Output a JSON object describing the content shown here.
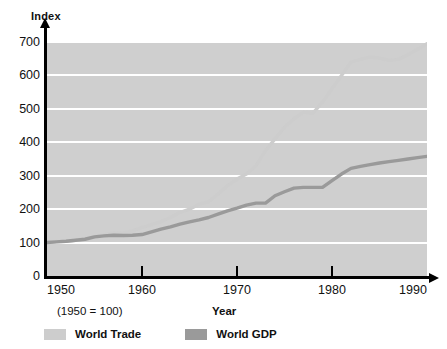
{
  "chart_data": {
    "type": "line",
    "title": "",
    "subtitle": "(1950 = 100)",
    "ylabel": "Index",
    "xlabel": "Year",
    "xlim": [
      1950,
      1990
    ],
    "ylim": [
      0,
      700
    ],
    "grid": true,
    "legend_position": "bottom-left",
    "xticks": [
      1950,
      1960,
      1970,
      1980,
      1990
    ],
    "xtick_labels": [
      "1950",
      "1960",
      "1970",
      "1980",
      "1990"
    ],
    "yticks": [
      0,
      100,
      200,
      300,
      400,
      500,
      600,
      700
    ],
    "ytick_labels": [
      "0",
      "100",
      "200",
      "300",
      "400",
      "500",
      "600",
      "700"
    ],
    "plot_background": "#cfcfcf",
    "gridline_color": "#ffffff",
    "series": [
      {
        "name": "World Trade",
        "color": "#cdcdcd",
        "x": [
          1950,
          1951,
          1952,
          1953,
          1954,
          1955,
          1956,
          1957,
          1958,
          1959,
          1960,
          1961,
          1962,
          1963,
          1964,
          1965,
          1966,
          1967,
          1968,
          1969,
          1970,
          1971,
          1972,
          1973,
          1974,
          1975,
          1976,
          1977,
          1978,
          1979,
          1980,
          1981,
          1982,
          1983,
          1984,
          1985,
          1986,
          1987,
          1988,
          1989,
          1990
        ],
        "values": [
          100,
          103,
          104,
          107,
          112,
          118,
          124,
          129,
          128,
          135,
          145,
          154,
          163,
          175,
          190,
          200,
          215,
          222,
          245,
          270,
          290,
          305,
          330,
          375,
          410,
          445,
          470,
          490,
          487,
          520,
          560,
          600,
          640,
          648,
          655,
          652,
          645,
          648,
          662,
          678,
          695
        ]
      },
      {
        "name": "World GDP",
        "color": "#9a9a9a",
        "x": [
          1950,
          1951,
          1952,
          1953,
          1954,
          1955,
          1956,
          1957,
          1958,
          1959,
          1960,
          1961,
          1962,
          1963,
          1964,
          1965,
          1966,
          1967,
          1968,
          1969,
          1970,
          1971,
          1972,
          1973,
          1974,
          1975,
          1976,
          1977,
          1978,
          1979,
          1980,
          1981,
          1982,
          1983,
          1984,
          1985,
          1986,
          1987,
          1988,
          1989,
          1990
        ],
        "values": [
          100,
          102,
          104,
          107,
          110,
          117,
          120,
          122,
          121,
          122,
          124,
          132,
          140,
          147,
          155,
          162,
          168,
          175,
          185,
          195,
          203,
          212,
          218,
          218,
          240,
          252,
          263,
          265,
          265,
          265,
          285,
          305,
          322,
          328,
          333,
          338,
          342,
          346,
          350,
          354,
          358
        ]
      }
    ]
  },
  "axes": {
    "y_title": "Index",
    "x_title": "Year",
    "caption": "(1950 = 100)"
  },
  "legend": {
    "items": [
      {
        "label": "World Trade",
        "color": "#cdcdcd"
      },
      {
        "label": "World GDP",
        "color": "#9a9a9a"
      }
    ]
  }
}
